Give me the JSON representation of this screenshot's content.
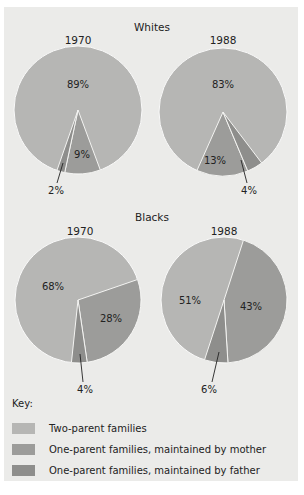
{
  "chart_data": {
    "type": "pie",
    "groups": [
      {
        "title": "Whites",
        "charts": [
          {
            "title": "1970",
            "values": {
              "two_parent": 89,
              "mother": 9,
              "father": 2
            }
          },
          {
            "title": "1988",
            "values": {
              "two_parent": 83,
              "mother": 13,
              "father": 4
            }
          }
        ]
      },
      {
        "title": "Blacks",
        "charts": [
          {
            "title": "1970",
            "values": {
              "two_parent": 68,
              "mother": 28,
              "father": 4
            }
          },
          {
            "title": "1988",
            "values": {
              "two_parent": 51,
              "mother": 43,
              "father": 6
            }
          }
        ]
      }
    ],
    "legend": {
      "title": "Key:",
      "entries": [
        {
          "key": "two_parent",
          "label": "Two-parent families",
          "color": "#b6b6b4"
        },
        {
          "key": "mother",
          "label": "One-parent families, maintained by mother",
          "color": "#9c9c9a"
        },
        {
          "key": "father",
          "label": "One-parent families, maintained by father",
          "color": "#8e8e8c"
        }
      ],
      "position": "bottom"
    },
    "units": "%"
  },
  "layout": {
    "pies": [
      {
        "cx": 78,
        "cy": 110,
        "r": 64,
        "title_y": 72,
        "title_x": 78,
        "segments": [
          {
            "key": "mother",
            "start": 159.6,
            "end": 192
          },
          {
            "key": "father",
            "start": 192,
            "end": 199.2
          }
        ],
        "labels": [
          {
            "text": "89%",
            "x": 78,
            "y": 88
          },
          {
            "text": "9%",
            "x": 82,
            "y": 158
          },
          {
            "text": "2%",
            "x": 56,
            "y": 194,
            "leader": [
              63,
              163,
              57,
              183
            ]
          }
        ]
      },
      {
        "cx": 223,
        "cy": 112,
        "r": 64,
        "title_y": 72,
        "title_x": 223,
        "segments": [
          {
            "key": "mother",
            "start": 157.2,
            "end": 204
          },
          {
            "key": "father",
            "start": 142.8,
            "end": 157.2
          }
        ],
        "labels": [
          {
            "text": "83%",
            "x": 223,
            "y": 88
          },
          {
            "text": "13%",
            "x": 215,
            "y": 164
          },
          {
            "text": "4%",
            "x": 249,
            "y": 194,
            "leader": [
              241,
              160,
              247,
              183
            ]
          }
        ]
      },
      {
        "cx": 78,
        "cy": 300,
        "r": 63,
        "title_y": 263,
        "title_x": 80,
        "segments": [
          {
            "key": "mother",
            "start": 71,
            "end": 171.6
          },
          {
            "key": "father",
            "start": 171.6,
            "end": 186
          }
        ],
        "labels": [
          {
            "text": "68%",
            "x": 53,
            "y": 290
          },
          {
            "text": "28%",
            "x": 111,
            "y": 322
          },
          {
            "text": "4%",
            "x": 85,
            "y": 393,
            "leader": [
              80,
              354,
              83,
              382
            ]
          }
        ]
      },
      {
        "cx": 224,
        "cy": 300,
        "r": 63,
        "title_y": 263,
        "title_x": 224,
        "segments": [
          {
            "key": "mother",
            "start": 18,
            "end": 176.4
          },
          {
            "key": "father",
            "start": 176.4,
            "end": 198
          }
        ],
        "labels": [
          {
            "text": "51%",
            "x": 190,
            "y": 304
          },
          {
            "text": "43%",
            "x": 251,
            "y": 310
          },
          {
            "text": "6%",
            "x": 209,
            "y": 393,
            "leader": [
              219,
              352,
              212,
              382
            ]
          }
        ]
      }
    ],
    "group_titles": [
      {
        "text": "Whites",
        "x": 152,
        "y": 31
      },
      {
        "text": "Blacks",
        "x": 152,
        "y": 221
      }
    ]
  }
}
